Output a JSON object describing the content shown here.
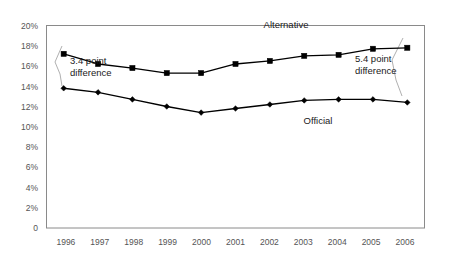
{
  "chart_data": {
    "type": "line",
    "title": "",
    "xlabel": "",
    "ylabel": "",
    "categories": [
      "1996",
      "1997",
      "1998",
      "1999",
      "2000",
      "2001",
      "2002",
      "2003",
      "2004",
      "2005",
      "2006"
    ],
    "ylim": [
      0,
      20
    ],
    "ytick_labels": [
      "0",
      "2%",
      "4%",
      "6%",
      "8%",
      "10%",
      "12%",
      "14%",
      "16%",
      "18%",
      "20%"
    ],
    "ytick_values": [
      0,
      2,
      4,
      6,
      8,
      10,
      12,
      14,
      16,
      18,
      20
    ],
    "grid": false,
    "legend": "inline-labels",
    "series": [
      {
        "name": "Alternative",
        "marker": "square",
        "values": [
          17.2,
          16.2,
          15.8,
          15.3,
          15.3,
          16.2,
          16.5,
          17.0,
          17.1,
          17.7,
          17.8
        ]
      },
      {
        "name": "Official",
        "marker": "diamond",
        "values": [
          13.8,
          13.4,
          12.7,
          12.0,
          11.4,
          11.8,
          12.2,
          12.6,
          12.7,
          12.7,
          12.4
        ]
      }
    ],
    "annotations": [
      {
        "id": "left-gap",
        "line1": "3.4 point",
        "line2": "difference",
        "value": 3.4,
        "at_category": "1996"
      },
      {
        "id": "right-gap",
        "line1": "5.4 point",
        "line2": "difference",
        "value": 5.4,
        "at_category": "2006"
      }
    ],
    "colors": {
      "series_line": "#000000",
      "marker": "#000000",
      "frame": "#8a8a8a",
      "tick_text": "#555555",
      "leader": "#b0b0b0",
      "background": "#ffffff"
    }
  }
}
